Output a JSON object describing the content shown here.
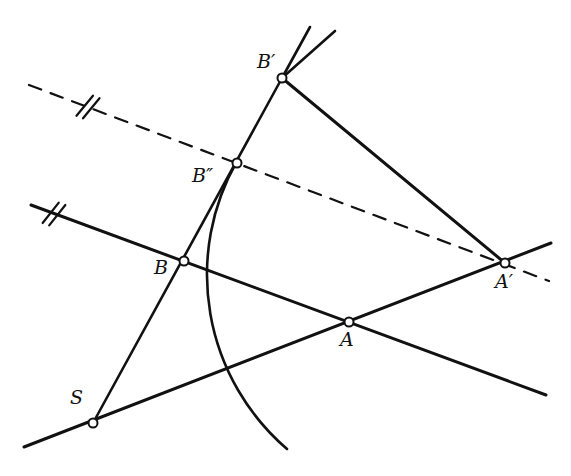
{
  "figure": {
    "type": "geometric-construction",
    "title": "",
    "background_color": "#ffffff",
    "stroke_color": "#111111",
    "width": 571,
    "height": 476
  },
  "points": [
    {
      "id": "B-prime",
      "label": "B′",
      "x": 282,
      "y": 78,
      "label_x": 257,
      "label_y": 52,
      "marker": "open-circle"
    },
    {
      "id": "B-double",
      "label": "B″",
      "x": 237,
      "y": 163,
      "label_x": 192,
      "label_y": 166,
      "marker": "open-circle"
    },
    {
      "id": "B",
      "label": "B",
      "x": 184,
      "y": 261,
      "label_x": 154,
      "label_y": 258,
      "marker": "open-circle"
    },
    {
      "id": "A",
      "label": "A",
      "x": 349,
      "y": 322,
      "label_x": 340,
      "label_y": 330,
      "marker": "open-circle"
    },
    {
      "id": "A-prime",
      "label": "A′",
      "x": 505,
      "y": 263,
      "label_x": 495,
      "label_y": 272,
      "marker": "open-circle"
    },
    {
      "id": "S",
      "label": "S",
      "x": 93,
      "y": 423,
      "label_x": 70,
      "label_y": 388,
      "marker": "open-circle"
    }
  ],
  "segments": [
    {
      "id": "line-through-B-and-Aprime",
      "style": "solid",
      "width": 3.0,
      "x1": 31,
      "y1": 205,
      "x2": 546,
      "y2": 395
    },
    {
      "id": "line-through-S-and-A",
      "style": "solid",
      "width": 3.0,
      "x1": 24,
      "y1": 447,
      "x2": 551,
      "y2": 243
    },
    {
      "id": "segment-S-to-Bprime",
      "style": "solid",
      "width": 2.6,
      "x1": 93,
      "y1": 423,
      "x2": 282,
      "y2": 78
    },
    {
      "id": "segment-Bprime-to-Aprime",
      "style": "solid",
      "width": 3.0,
      "x1": 282,
      "y1": 78,
      "x2": 505,
      "y2": 263
    },
    {
      "id": "ray-from-Bprime-upper",
      "style": "solid",
      "width": 2.6,
      "x1": 282,
      "y1": 78,
      "x2": 310,
      "y2": 27
    },
    {
      "id": "ray-from-Bprime-outer",
      "style": "solid",
      "width": 2.6,
      "x1": 282,
      "y1": 78,
      "x2": 335,
      "y2": 31
    },
    {
      "id": "dashed-line-Bdouble-Aprime",
      "style": "dashed",
      "width": 2.2,
      "x1": 29,
      "y1": 85,
      "x2": 549,
      "y2": 281
    }
  ],
  "arc": {
    "id": "arc-through-Bdouble",
    "style": "solid",
    "width": 2.6,
    "start_x": 237,
    "start_y": 161,
    "end_x": 287,
    "end_y": 449,
    "radius": 230,
    "sweep": 0,
    "large_arc": 0,
    "description": "circular arc centered right of the figure passing through B-double and curving down past the lines"
  },
  "tick_marks": [
    {
      "id": "tick-on-dashed-line",
      "count": 2,
      "x": 88,
      "y": 107,
      "angle_deg": 21,
      "length": 26,
      "spacing": 7,
      "on": "dashed-line-Bdouble-Aprime"
    },
    {
      "id": "tick-on-solid-line",
      "count": 2,
      "x": 54,
      "y": 214,
      "angle_deg": 20,
      "length": 26,
      "spacing": 7,
      "on": "line-through-B-and-Aprime"
    }
  ],
  "marker_style": {
    "fill": "#ffffff",
    "stroke": "#111111",
    "radius": 4.5,
    "stroke_width": 2.0
  }
}
